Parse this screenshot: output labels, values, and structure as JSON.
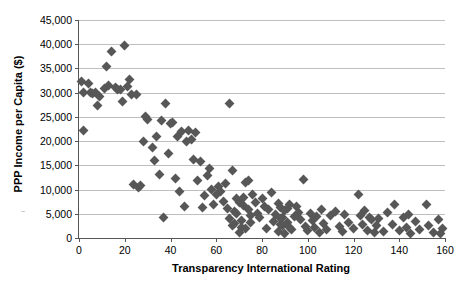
{
  "chart": {
    "type": "scatter",
    "title": "",
    "xlabel": "Transparency International Rating",
    "ylabel": "PPP Income per Capita ($)",
    "marker_color": "#575757",
    "grid_color": "#bfbfbf",
    "axis_color": "#555555",
    "grid": "horizontal",
    "legend": "none"
  },
  "chart_data": {
    "type": "scatter",
    "title": "",
    "xlabel": "Transparency International Rating",
    "ylabel": "PPP Income per Capita ($)",
    "xlim": [
      0,
      160
    ],
    "ylim": [
      0,
      45000
    ],
    "xticks": [
      0,
      20,
      40,
      60,
      80,
      100,
      120,
      140,
      160
    ],
    "ytickLabels": [
      "0",
      "5,000",
      "10,000",
      "15,000",
      "20,000",
      "25,000",
      "30,000",
      "35,000",
      "40,000",
      "45,000"
    ],
    "xtickLabels": [
      "0",
      "20",
      "40",
      "60",
      "80",
      "100",
      "120",
      "140",
      "160"
    ],
    "yticks": [
      0,
      5000,
      10000,
      15000,
      20000,
      25000,
      30000,
      35000,
      40000,
      45000
    ],
    "grid": "horizontal",
    "legend_position": "none",
    "series": [
      {
        "name": "Countries",
        "marker": "diamond",
        "color": "#575757",
        "points": [
          [
            1,
            32400
          ],
          [
            2,
            30000
          ],
          [
            2,
            22100
          ],
          [
            4,
            31800
          ],
          [
            5,
            30100
          ],
          [
            6,
            29900
          ],
          [
            7,
            30000
          ],
          [
            8,
            27400
          ],
          [
            9,
            29300
          ],
          [
            11,
            30900
          ],
          [
            12,
            35500
          ],
          [
            13,
            31400
          ],
          [
            14,
            38400
          ],
          [
            16,
            31100
          ],
          [
            17,
            30700
          ],
          [
            18,
            30600
          ],
          [
            19,
            28100
          ],
          [
            20,
            39700
          ],
          [
            21,
            31200
          ],
          [
            22,
            32800
          ],
          [
            23,
            29600
          ],
          [
            24,
            11000
          ],
          [
            25,
            29700
          ],
          [
            26,
            10500
          ],
          [
            28,
            19900
          ],
          [
            30,
            24500
          ],
          [
            32,
            18600
          ],
          [
            34,
            21000
          ],
          [
            35,
            13200
          ],
          [
            36,
            24200
          ],
          [
            37,
            4300
          ],
          [
            38,
            27800
          ],
          [
            39,
            17400
          ],
          [
            40,
            23600
          ],
          [
            41,
            23900
          ],
          [
            42,
            12300
          ],
          [
            43,
            20900
          ],
          [
            44,
            9500
          ],
          [
            45,
            21900
          ],
          [
            46,
            6500
          ],
          [
            47,
            19900
          ],
          [
            48,
            22100
          ],
          [
            49,
            20400
          ],
          [
            50,
            16200
          ],
          [
            51,
            21800
          ],
          [
            52,
            11800
          ],
          [
            53,
            15800
          ],
          [
            54,
            6300
          ],
          [
            55,
            8700
          ],
          [
            56,
            12800
          ],
          [
            57,
            14300
          ],
          [
            58,
            10100
          ],
          [
            59,
            6900
          ],
          [
            60,
            8900
          ],
          [
            61,
            10700
          ],
          [
            62,
            9700
          ],
          [
            63,
            7600
          ],
          [
            64,
            11200
          ],
          [
            65,
            6100
          ],
          [
            66,
            27800
          ],
          [
            67,
            13900
          ],
          [
            68,
            5400
          ],
          [
            69,
            8100
          ],
          [
            70,
            7400
          ],
          [
            71,
            2200
          ],
          [
            72,
            6800
          ],
          [
            73,
            11500
          ],
          [
            74,
            11900
          ],
          [
            75,
            4600
          ],
          [
            76,
            9000
          ],
          [
            77,
            7300
          ],
          [
            78,
            5100
          ],
          [
            79,
            4200
          ],
          [
            80,
            8200
          ],
          [
            81,
            6600
          ],
          [
            82,
            2000
          ],
          [
            83,
            5800
          ],
          [
            84,
            9400
          ],
          [
            85,
            3400
          ],
          [
            86,
            4800
          ],
          [
            87,
            7100
          ],
          [
            88,
            6200
          ],
          [
            88,
            4100
          ],
          [
            89,
            2600
          ],
          [
            90,
            5600
          ],
          [
            91,
            3200
          ],
          [
            92,
            7000
          ],
          [
            93,
            1800
          ],
          [
            94,
            4500
          ],
          [
            95,
            6400
          ],
          [
            96,
            5200
          ],
          [
            97,
            3900
          ],
          [
            98,
            12100
          ],
          [
            99,
            2400
          ],
          [
            100,
            1500
          ],
          [
            101,
            5000
          ],
          [
            102,
            3600
          ],
          [
            103,
            2100
          ],
          [
            104,
            4400
          ],
          [
            105,
            1200
          ],
          [
            106,
            5900
          ],
          [
            107,
            2900
          ],
          [
            108,
            1700
          ],
          [
            110,
            4700
          ],
          [
            112,
            5500
          ],
          [
            114,
            2300
          ],
          [
            115,
            1400
          ],
          [
            116,
            4900
          ],
          [
            118,
            3100
          ],
          [
            120,
            1900
          ],
          [
            122,
            8900
          ],
          [
            123,
            4600
          ],
          [
            124,
            2700
          ],
          [
            125,
            5700
          ],
          [
            126,
            1600
          ],
          [
            127,
            4300
          ],
          [
            128,
            3800
          ],
          [
            129,
            1100
          ],
          [
            130,
            2500
          ],
          [
            131,
            4100
          ],
          [
            133,
            1300
          ],
          [
            135,
            5200
          ],
          [
            137,
            2800
          ],
          [
            138,
            6900
          ],
          [
            140,
            1500
          ],
          [
            142,
            4200
          ],
          [
            143,
            2200
          ],
          [
            144,
            4900
          ],
          [
            145,
            1000
          ],
          [
            147,
            3500
          ],
          [
            149,
            1800
          ],
          [
            152,
            7000
          ],
          [
            153,
            2600
          ],
          [
            155,
            1200
          ],
          [
            157,
            3900
          ],
          [
            158,
            900
          ],
          [
            159,
            2000
          ],
          [
            87,
            1400
          ],
          [
            88,
            2800
          ],
          [
            89,
            4300
          ],
          [
            90,
            900
          ],
          [
            91,
            6100
          ],
          [
            92,
            2100
          ],
          [
            66,
            4000
          ],
          [
            67,
            2500
          ],
          [
            68,
            3000
          ],
          [
            69,
            5100
          ],
          [
            70,
            1100
          ],
          [
            71,
            3700
          ],
          [
            72,
            8400
          ],
          [
            73,
            1900
          ],
          [
            74,
            5900
          ],
          [
            75,
            3300
          ],
          [
            33,
            15900
          ],
          [
            29,
            25100
          ],
          [
            27,
            10800
          ]
        ]
      }
    ]
  }
}
